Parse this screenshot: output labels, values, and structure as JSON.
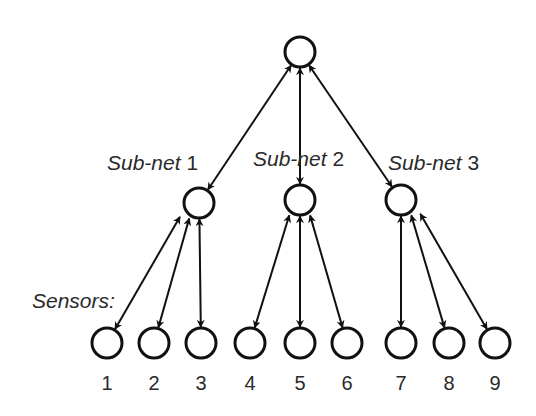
{
  "colors": {
    "stroke": "#111111",
    "text": "#2a2a2a",
    "background": "#ffffff"
  },
  "root": {
    "x": 300,
    "y": 52,
    "r": 15
  },
  "subnets": [
    {
      "label": "Sub-net 1",
      "x": 199,
      "y": 203,
      "r": 15,
      "label_x": 107,
      "label_y": 170,
      "sensors": [
        0,
        1,
        2
      ]
    },
    {
      "label": "Sub-net 2",
      "x": 300,
      "y": 200,
      "r": 15,
      "label_x": 253,
      "label_y": 166,
      "sensors": [
        3,
        4,
        5
      ]
    },
    {
      "label": "Sub-net 3",
      "x": 401,
      "y": 200,
      "r": 15,
      "label_x": 388,
      "label_y": 170,
      "sensors": [
        6,
        7,
        8
      ]
    }
  ],
  "sensors_label": {
    "text": "Sensors:",
    "x": 32,
    "y": 308
  },
  "sensors": [
    {
      "label": "1",
      "x": 107,
      "y": 343
    },
    {
      "label": "2",
      "x": 154,
      "y": 343
    },
    {
      "label": "3",
      "x": 201,
      "y": 343
    },
    {
      "label": "4",
      "x": 250,
      "y": 343
    },
    {
      "label": "5",
      "x": 300,
      "y": 343
    },
    {
      "label": "6",
      "x": 347,
      "y": 343
    },
    {
      "label": "7",
      "x": 401,
      "y": 343
    },
    {
      "label": "8",
      "x": 449,
      "y": 343
    },
    {
      "label": "9",
      "x": 495,
      "y": 343
    }
  ],
  "sensor_radius": 15,
  "number_label_y": 390
}
